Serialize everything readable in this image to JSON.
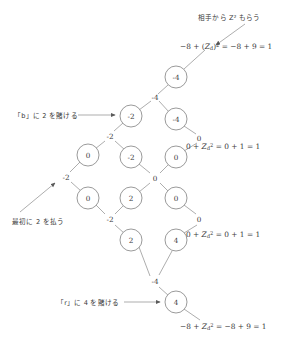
{
  "figure": {
    "type": "binomial-lattice-diagram",
    "title": "",
    "nodes": [
      {
        "id": "n-top",
        "label": "-4",
        "x": 176,
        "y": 77,
        "r": 11
      },
      {
        "id": "n-left-upper",
        "label": "-2",
        "x": 131,
        "y": 116,
        "r": 11
      },
      {
        "id": "n-right-upper",
        "label": "-4",
        "x": 176,
        "y": 119,
        "r": 11
      },
      {
        "id": "n-l2-a",
        "label": "0",
        "x": 88,
        "y": 155,
        "r": 11
      },
      {
        "id": "n-l2-b",
        "label": "-2",
        "x": 131,
        "y": 157,
        "r": 11
      },
      {
        "id": "n-l2-c",
        "label": "0",
        "x": 176,
        "y": 157,
        "r": 11
      },
      {
        "id": "n-l3-a",
        "label": "0",
        "x": 88,
        "y": 198,
        "r": 11
      },
      {
        "id": "n-l3-b",
        "label": "2",
        "x": 131,
        "y": 198,
        "r": 11
      },
      {
        "id": "n-l3-c",
        "label": "0",
        "x": 176,
        "y": 198,
        "r": 11
      },
      {
        "id": "n-l4-b",
        "label": "2",
        "x": 131,
        "y": 240,
        "r": 11
      },
      {
        "id": "n-l4-c",
        "label": "4",
        "x": 176,
        "y": 240,
        "r": 11
      },
      {
        "id": "n-bottom",
        "label": "4",
        "x": 176,
        "y": 302,
        "r": 11
      }
    ],
    "junctions": [
      {
        "id": "j-top",
        "label": "-4",
        "x": 155,
        "y": 97
      },
      {
        "id": "j-mid-l",
        "label": "-2",
        "x": 110,
        "y": 136
      },
      {
        "id": "j-right1",
        "label": "0",
        "x": 199,
        "y": 138
      },
      {
        "id": "j-left1",
        "label": "-2",
        "x": 66,
        "y": 177
      },
      {
        "id": "j-center",
        "label": "0",
        "x": 155,
        "y": 178
      },
      {
        "id": "j-mid-b",
        "label": "-2",
        "x": 110,
        "y": 219
      },
      {
        "id": "j-right2",
        "label": "0",
        "x": 199,
        "y": 219
      },
      {
        "id": "j-bottom",
        "label": "-4",
        "x": 155,
        "y": 281
      }
    ],
    "edges": [
      {
        "from": "n-top",
        "to": "up-right-tail"
      },
      {
        "from": "n-top",
        "to": "j-top"
      },
      {
        "from": "j-top",
        "to": "n-left-upper"
      },
      {
        "from": "j-top",
        "to": "n-right-upper"
      },
      {
        "from": "n-left-upper",
        "to": "j-mid-l"
      },
      {
        "from": "n-right-upper",
        "to": "j-right1"
      },
      {
        "from": "j-mid-l",
        "to": "n-l2-a"
      },
      {
        "from": "j-mid-l",
        "to": "n-l2-b"
      },
      {
        "from": "j-right1",
        "to": "n-l2-c"
      },
      {
        "from": "n-l2-a",
        "to": "j-left1"
      },
      {
        "from": "n-l2-b",
        "to": "j-center"
      },
      {
        "from": "n-l2-c",
        "to": "j-center"
      },
      {
        "from": "j-left1",
        "to": "n-l3-a"
      },
      {
        "from": "j-center",
        "to": "n-l3-b"
      },
      {
        "from": "j-center",
        "to": "n-l3-c"
      },
      {
        "from": "n-l3-a",
        "to": "j-mid-b"
      },
      {
        "from": "n-l3-b",
        "to": "j-mid-b"
      },
      {
        "from": "n-l3-c",
        "to": "j-right2"
      },
      {
        "from": "j-mid-b",
        "to": "n-l4-b"
      },
      {
        "from": "j-right2",
        "to": "n-l4-c"
      },
      {
        "from": "n-l4-b",
        "to": "j-bottom"
      },
      {
        "from": "n-l4-c",
        "to": "j-bottom"
      },
      {
        "from": "j-bottom",
        "to": "n-bottom"
      },
      {
        "from": "n-bottom",
        "to": "down-right-tail"
      }
    ]
  },
  "annotations": {
    "top_right_note": "相手から Z² もらう",
    "bet_b_note": "「b」に 2 を賭ける",
    "pay_first_note": "最初に 2 を払う",
    "bet_r_note": "「r」に 4 を賭ける"
  },
  "formulas": {
    "top": {
      "full": "-8 + (Zd)2 = -8 + 9 = 1",
      "lead": "−8 + (",
      "var": "Z",
      "sub": "d",
      "mid": ")",
      "sup": "2",
      "tail": " = −8 + 9 = 1"
    },
    "upper_right": {
      "full": "0 + Zd2 = 0 + 1 = 1",
      "lead": "0 + ",
      "var": "Z",
      "sub": "d",
      "sup": "2",
      "tail": " = 0 + 1 = 1"
    },
    "lower_right": {
      "full": "0 + Zd2 = 0 + 1 = 1",
      "lead": "0 + ",
      "var": "Z",
      "sub": "d",
      "sup": "2",
      "tail": " = 0 + 1 = 1"
    },
    "bottom": {
      "full": "-8 + Zd2 = -8 + 9 = 1",
      "lead": "−8 + ",
      "var": "Z",
      "sub": "d",
      "sup": "2",
      "tail": " = −8 + 9 = 1"
    }
  },
  "colors": {
    "stroke": "#8a8a8a",
    "text": "#3a3a3a",
    "background": "#ffffff"
  }
}
